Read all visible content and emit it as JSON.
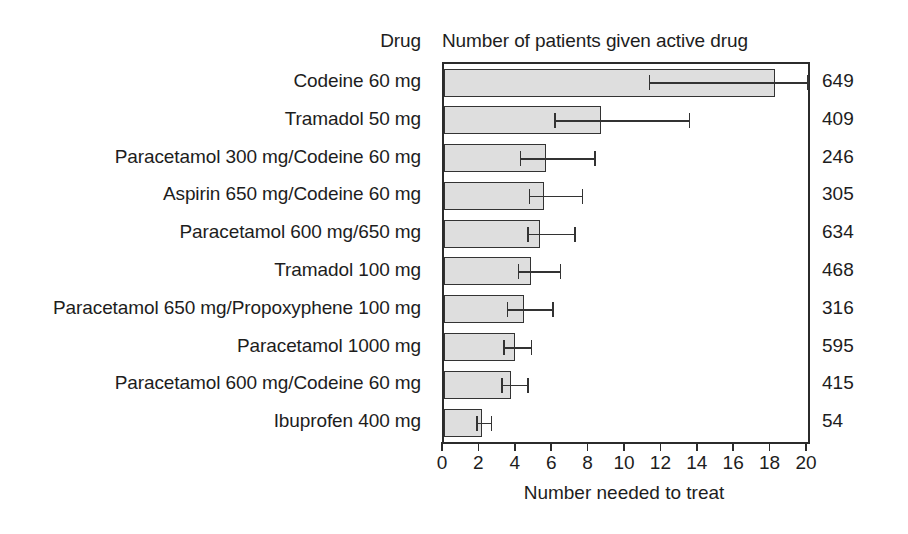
{
  "header": {
    "drug_column": "Drug",
    "patients_column": "Number of patients given active drug"
  },
  "axis": {
    "xlabel": "Number needed to treat",
    "ticks": [
      "0",
      "2",
      "4",
      "6",
      "8",
      "10",
      "12",
      "14",
      "16",
      "18",
      "20"
    ]
  },
  "colors": {
    "bar_fill": "#dedede",
    "bar_stroke": "#333333",
    "axis": "#2b2b2b",
    "text": "#1d1d1d",
    "background": "#ffffff"
  },
  "chart_data": {
    "type": "bar",
    "orientation": "horizontal",
    "title": "",
    "xlabel": "Number needed to treat",
    "ylabel": "Drug",
    "xlim": [
      0,
      20
    ],
    "xticks": [
      0,
      2,
      4,
      6,
      8,
      10,
      12,
      14,
      16,
      18,
      20
    ],
    "grid": false,
    "legend": false,
    "error_bars": "95% confidence interval",
    "categories": [
      "Codeine 60 mg",
      "Tramadol 50 mg",
      "Paracetamol 300 mg/Codeine 60 mg",
      "Aspirin 650 mg/Codeine 60 mg",
      "Paracetamol 600 mg/650 mg",
      "Tramadol 100 mg",
      "Paracetamol 650 mg/Propoxyphene 100 mg",
      "Paracetamol 1000 mg",
      "Paracetamol 600 mg/Codeine 60 mg",
      "Ibuprofen 400 mg"
    ],
    "values": [
      18.2,
      8.6,
      5.6,
      5.5,
      5.3,
      4.8,
      4.4,
      3.9,
      3.7,
      2.1
    ],
    "ci_low": [
      11.3,
      6.1,
      4.2,
      4.7,
      4.6,
      4.1,
      3.5,
      3.3,
      3.2,
      1.8
    ],
    "ci_high": [
      20.0,
      13.5,
      8.3,
      7.6,
      7.2,
      6.4,
      6.0,
      4.8,
      4.6,
      2.6
    ],
    "secondary_series": {
      "name": "Number of patients given active drug",
      "values": [
        649,
        409,
        246,
        305,
        634,
        468,
        316,
        595,
        415,
        54
      ]
    }
  },
  "rows": [
    {
      "label": "Codeine 60 mg",
      "value": 18.2,
      "ci_low": 11.3,
      "ci_high": 20.0,
      "patients": "649"
    },
    {
      "label": "Tramadol 50 mg",
      "value": 8.6,
      "ci_low": 6.1,
      "ci_high": 13.5,
      "patients": "409"
    },
    {
      "label": "Paracetamol 300 mg/Codeine 60 mg",
      "value": 5.6,
      "ci_low": 4.2,
      "ci_high": 8.3,
      "patients": "246"
    },
    {
      "label": "Aspirin 650 mg/Codeine 60 mg",
      "value": 5.5,
      "ci_low": 4.7,
      "ci_high": 7.6,
      "patients": "305"
    },
    {
      "label": "Paracetamol 600 mg/650 mg",
      "value": 5.3,
      "ci_low": 4.6,
      "ci_high": 7.2,
      "patients": "634"
    },
    {
      "label": "Tramadol 100 mg",
      "value": 4.8,
      "ci_low": 4.1,
      "ci_high": 6.4,
      "patients": "468"
    },
    {
      "label": "Paracetamol 650 mg/Propoxyphene 100 mg",
      "value": 4.4,
      "ci_low": 3.5,
      "ci_high": 6.0,
      "patients": "316"
    },
    {
      "label": "Paracetamol 1000 mg",
      "value": 3.9,
      "ci_low": 3.3,
      "ci_high": 4.8,
      "patients": "595"
    },
    {
      "label": "Paracetamol 600 mg/Codeine 60 mg",
      "value": 3.7,
      "ci_low": 3.2,
      "ci_high": 4.6,
      "patients": "415"
    },
    {
      "label": "Ibuprofen 400 mg",
      "value": 2.1,
      "ci_low": 1.8,
      "ci_high": 2.6,
      "patients": "54"
    }
  ]
}
